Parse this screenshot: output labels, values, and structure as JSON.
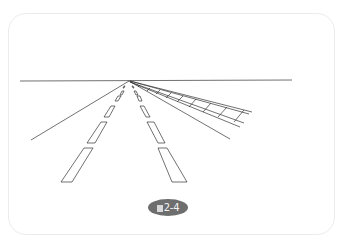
{
  "figure": {
    "caption_prefix_icon": "figure-char-block",
    "caption": "2-4",
    "caption_full": "图2-4",
    "colors": {
      "line": "#333333",
      "caption_bg": "#6e6e6e",
      "caption_text": "#f3f3f3",
      "frame_border": "#ececec"
    }
  }
}
